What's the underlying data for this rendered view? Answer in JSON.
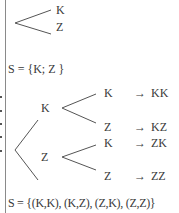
{
  "stage1": {
    "branches": [
      "K",
      "Z"
    ],
    "sample_space": "S = {K; Z }"
  },
  "stage2": {
    "first_level": [
      "K",
      "Z"
    ],
    "second_level": [
      "K",
      "Z",
      "K",
      "Z"
    ],
    "arrow": "→",
    "outcomes": [
      "KK",
      "KZ",
      "ZK",
      "ZZ"
    ],
    "sample_space": "S = {(K,K), (K,Z), (Z,K), (Z,Z)}"
  },
  "colors": {
    "line": "#555555",
    "text": "#3a3a3a",
    "border": "#8a8a8a"
  }
}
